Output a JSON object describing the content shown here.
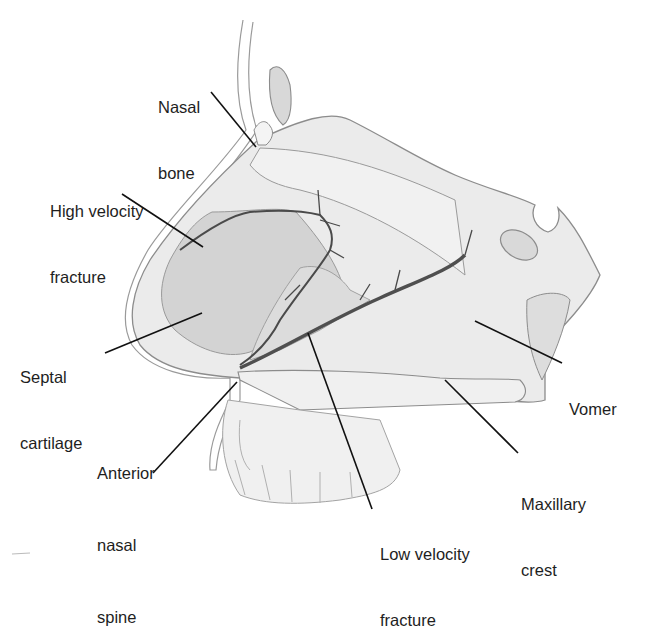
{
  "figure": {
    "colors": {
      "background": "#ffffff",
      "bone_fill": "#ececec",
      "cartilage_fill": "#d2d2d2",
      "outline": "#8c8c8c",
      "fracture": "#4a4a4a",
      "leader_line": "#111111",
      "text": "#1e1e1e"
    },
    "labels": [
      {
        "id": "nasal-bone",
        "lines": [
          "Nasal",
          "bone"
        ]
      },
      {
        "id": "high-velocity-fracture",
        "lines": [
          "High velocity",
          "fracture"
        ]
      },
      {
        "id": "septal-cartilage",
        "lines": [
          "Septal",
          "cartilage"
        ]
      },
      {
        "id": "anterior-nasal-spine",
        "lines": [
          "Anterior",
          "nasal",
          "spine"
        ]
      },
      {
        "id": "low-velocity-fracture",
        "lines": [
          "Low velocity",
          "fracture"
        ]
      },
      {
        "id": "maxillary-crest",
        "lines": [
          "Maxillary",
          "crest"
        ]
      },
      {
        "id": "vomer",
        "lines": [
          "Vomer"
        ]
      }
    ]
  }
}
